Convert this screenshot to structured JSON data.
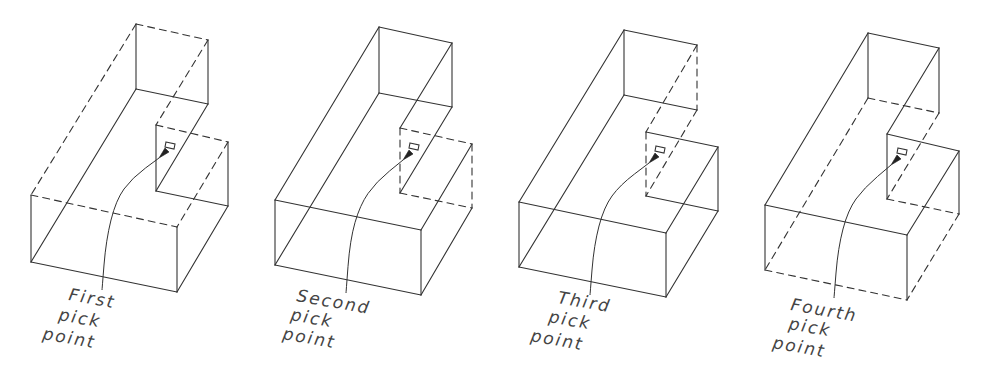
{
  "figure": {
    "stroke_color": "#333333",
    "background": "#ffffff"
  },
  "panels": [
    {
      "id": "first",
      "label_lines": [
        "First",
        "pick",
        "point"
      ],
      "label_pos": [
        [
          68,
          300
        ],
        [
          58,
          320
        ],
        [
          42,
          339
        ]
      ],
      "points": {
        "BTL": [
          136,
          24
        ],
        "TR": [
          208,
          40
        ],
        "IBB": [
          136,
          89
        ],
        "RVB": [
          208,
          104
        ],
        "NTL": [
          156,
          125
        ],
        "NTR": [
          228,
          142
        ],
        "NBL": [
          156,
          191
        ],
        "NBR": [
          228,
          206
        ],
        "FTL": [
          31,
          195
        ],
        "FTR": [
          177,
          227
        ],
        "FBL": [
          31,
          262
        ],
        "FBR": [
          177,
          292
        ]
      },
      "dashed_edges": [
        "BTL-TR",
        "FTL-BTL",
        "FTL-FTR",
        "TR-NTL",
        "NTL-NTR",
        "NTR-FTR"
      ],
      "pick_box": [
        170,
        146
      ],
      "arrow_tip": [
        159,
        158
      ],
      "leader": [
        [
          102,
          290
        ],
        [
          106,
          240
        ],
        [
          116,
          200
        ],
        [
          132,
          178
        ],
        [
          159,
          158
        ]
      ]
    },
    {
      "id": "second",
      "label_lines": [
        "Second",
        "pick",
        "point"
      ],
      "label_pos": [
        [
          296,
          301
        ],
        [
          290,
          320
        ],
        [
          282,
          339
        ]
      ],
      "points": {
        "BTL": [
          379,
          27
        ],
        "TR": [
          452,
          43
        ],
        "IBB": [
          379,
          93
        ],
        "RVB": [
          452,
          107
        ],
        "NTL": [
          400,
          128
        ],
        "NTR": [
          472,
          144
        ],
        "NBL": [
          400,
          193
        ],
        "NBR": [
          472,
          208
        ],
        "FTL": [
          275,
          200
        ],
        "FTR": [
          421,
          230
        ],
        "FBL": [
          275,
          265
        ],
        "FBR": [
          421,
          295
        ]
      },
      "dashed_edges": [
        "NTL-NBL",
        "NTL-NTR",
        "NTR-NBR",
        "NBL-NBR"
      ],
      "pick_box": [
        414,
        147
      ],
      "arrow_tip": [
        403,
        160
      ],
      "leader": [
        [
          346,
          293
        ],
        [
          350,
          240
        ],
        [
          360,
          205
        ],
        [
          376,
          182
        ],
        [
          403,
          160
        ]
      ]
    },
    {
      "id": "third",
      "label_lines": [
        "Third",
        "pick",
        "point"
      ],
      "label_pos": [
        [
          557,
          303
        ],
        [
          548,
          322
        ],
        [
          530,
          341
        ]
      ],
      "points": {
        "BTL": [
          624,
          30
        ],
        "TR": [
          697,
          45
        ],
        "IBB": [
          624,
          95
        ],
        "RVB": [
          697,
          110
        ],
        "NTL": [
          646,
          132
        ],
        "NTR": [
          718,
          147
        ],
        "NBL": [
          646,
          196
        ],
        "NBR": [
          718,
          211
        ],
        "FTL": [
          519,
          202
        ],
        "FTR": [
          666,
          233
        ],
        "FBL": [
          519,
          267
        ],
        "FBR": [
          666,
          297
        ]
      },
      "dashed_edges": [
        "TR-RVB",
        "TR-NTL",
        "RVB-NBL",
        "NTL-NBL"
      ],
      "pick_box": [
        660,
        150
      ],
      "arrow_tip": [
        649,
        163
      ],
      "leader": [
        [
          590,
          295
        ],
        [
          594,
          245
        ],
        [
          604,
          207
        ],
        [
          620,
          185
        ],
        [
          649,
          163
        ]
      ]
    },
    {
      "id": "fourth",
      "label_lines": [
        "Fourth",
        "pick",
        "point"
      ],
      "label_pos": [
        [
          790,
          310
        ],
        [
          788,
          329
        ],
        [
          772,
          348
        ]
      ],
      "points": {
        "BTL": [
          868,
          33
        ],
        "TR": [
          939,
          48
        ],
        "IBB": [
          868,
          98
        ],
        "RVB": [
          939,
          113
        ],
        "NTL": [
          887,
          134
        ],
        "NTR": [
          959,
          151
        ],
        "NBL": [
          887,
          199
        ],
        "NBR": [
          959,
          214
        ],
        "FTL": [
          765,
          205
        ],
        "FTR": [
          907,
          235
        ],
        "FBL": [
          765,
          270
        ],
        "FBR": [
          907,
          300
        ]
      },
      "dashed_edges": [
        "IBB-RVB",
        "IBB-FBL",
        "FBL-FBR",
        "FBR-NBR",
        "NBL-NBR",
        "RVB-NBL"
      ],
      "pick_box": [
        902,
        152
      ],
      "arrow_tip": [
        891,
        165
      ],
      "leader": [
        [
          834,
          298
        ],
        [
          838,
          248
        ],
        [
          848,
          210
        ],
        [
          864,
          188
        ],
        [
          891,
          165
        ]
      ]
    }
  ],
  "edges": [
    "BTL-TR",
    "BTL-IBB",
    "TR-RVB",
    "IBB-RVB",
    "TR-NTL",
    "RVB-NBL",
    "NTL-NTR",
    "NTL-NBL",
    "NTR-NBR",
    "NBL-NBR",
    "NTR-FTR",
    "NBR-FBR",
    "BTL-FTL",
    "IBB-FBL",
    "FTL-FTR",
    "FTL-FBL",
    "FTR-FBR",
    "FBL-FBR"
  ]
}
